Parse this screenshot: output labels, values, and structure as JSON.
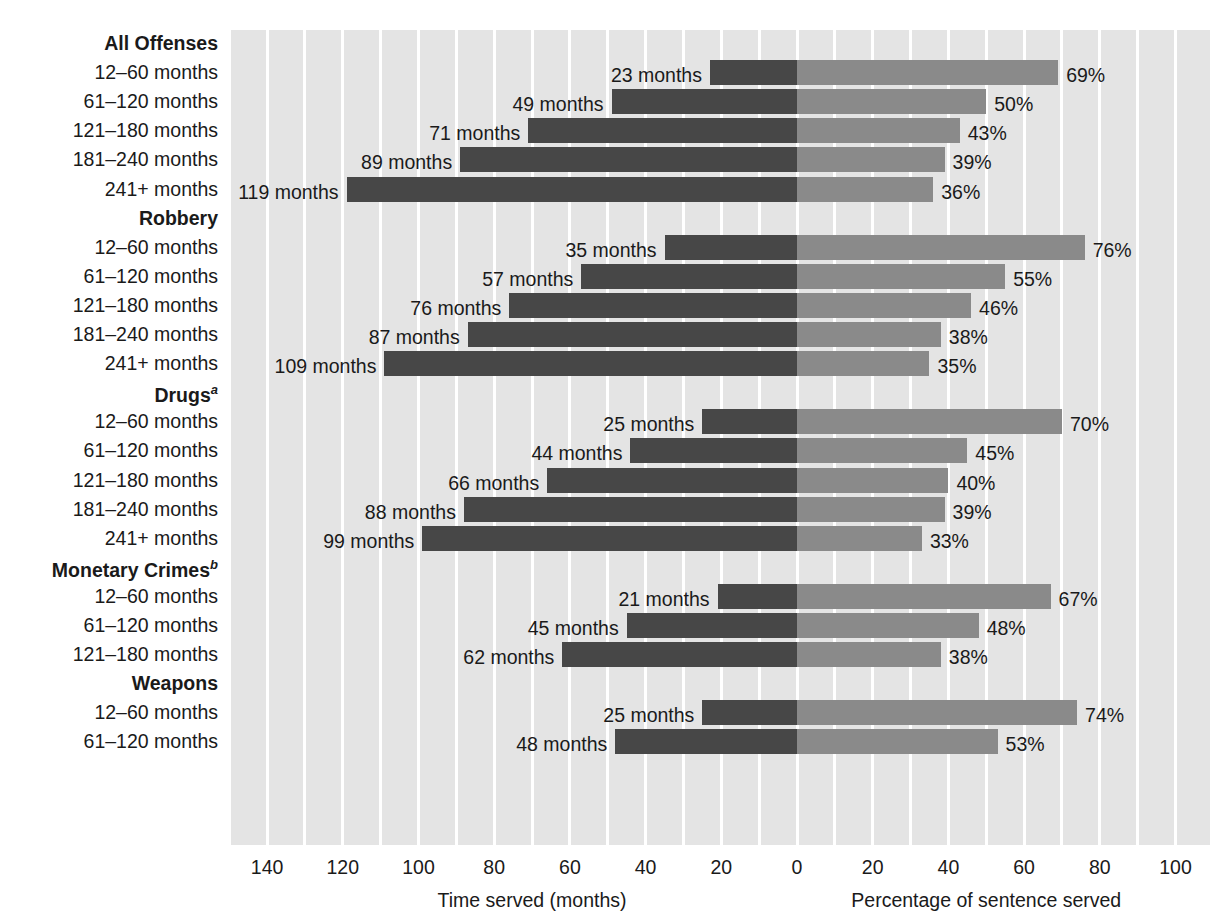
{
  "chart_data": {
    "type": "bar",
    "orientation": "horizontal",
    "variant": "diverging-bidirectional",
    "title": "",
    "left_axis": {
      "label": "Time served (months)",
      "ticks": [
        140,
        120,
        100,
        80,
        60,
        40,
        20,
        0
      ],
      "range": [
        150,
        0
      ],
      "direction": "right-to-left",
      "unit": "months"
    },
    "right_axis": {
      "label": "Percentage of sentence served",
      "ticks": [
        0,
        20,
        40,
        60,
        80,
        100
      ],
      "range": [
        0,
        109
      ],
      "direction": "left-to-right",
      "unit": "%"
    },
    "series": [
      {
        "name": "Time served (months)",
        "color": "#474747",
        "side": "left"
      },
      {
        "name": "Percentage of sentence served",
        "color": "#8a8a8a",
        "side": "right"
      }
    ],
    "grid": true,
    "gridline_interval": 10,
    "legend": "none",
    "groups": [
      {
        "name": "All Offenses",
        "footnote": "",
        "rows": [
          {
            "label": "12–60 months",
            "months": 23,
            "months_label": "23 months",
            "percent": 69,
            "percent_label": "69%"
          },
          {
            "label": "61–120 months",
            "months": 49,
            "months_label": "49 months",
            "percent": 50,
            "percent_label": "50%"
          },
          {
            "label": "121–180 months",
            "months": 71,
            "months_label": "71 months",
            "percent": 43,
            "percent_label": "43%"
          },
          {
            "label": "181–240 months",
            "months": 89,
            "months_label": "89 months",
            "percent": 39,
            "percent_label": "39%"
          },
          {
            "label": "241+ months",
            "months": 119,
            "months_label": "119 months",
            "percent": 36,
            "percent_label": "36%"
          }
        ]
      },
      {
        "name": "Robbery",
        "footnote": "",
        "rows": [
          {
            "label": "12–60 months",
            "months": 35,
            "months_label": "35 months",
            "percent": 76,
            "percent_label": "76%"
          },
          {
            "label": "61–120 months",
            "months": 57,
            "months_label": "57 months",
            "percent": 55,
            "percent_label": "55%"
          },
          {
            "label": "121–180 months",
            "months": 76,
            "months_label": "76 months",
            "percent": 46,
            "percent_label": "46%"
          },
          {
            "label": "181–240 months",
            "months": 87,
            "months_label": "87 months",
            "percent": 38,
            "percent_label": "38%"
          },
          {
            "label": "241+ months",
            "months": 109,
            "months_label": "109 months",
            "percent": 35,
            "percent_label": "35%"
          }
        ]
      },
      {
        "name": "Drugs",
        "footnote": "a",
        "rows": [
          {
            "label": "12–60 months",
            "months": 25,
            "months_label": "25 months",
            "percent": 70,
            "percent_label": "70%"
          },
          {
            "label": "61–120 months",
            "months": 44,
            "months_label": "44 months",
            "percent": 45,
            "percent_label": "45%"
          },
          {
            "label": "121–180 months",
            "months": 66,
            "months_label": "66 months",
            "percent": 40,
            "percent_label": "40%"
          },
          {
            "label": "181–240 months",
            "months": 88,
            "months_label": "88 months",
            "percent": 39,
            "percent_label": "39%"
          },
          {
            "label": "241+ months",
            "months": 99,
            "months_label": "99 months",
            "percent": 33,
            "percent_label": "33%"
          }
        ]
      },
      {
        "name": "Monetary Crimes",
        "footnote": "b",
        "rows": [
          {
            "label": "12–60 months",
            "months": 21,
            "months_label": "21 months",
            "percent": 67,
            "percent_label": "67%"
          },
          {
            "label": "61–120 months",
            "months": 45,
            "months_label": "45 months",
            "percent": 48,
            "percent_label": "48%"
          },
          {
            "label": "121–180 months",
            "months": 62,
            "months_label": "62 months",
            "percent": 38,
            "percent_label": "38%"
          }
        ]
      },
      {
        "name": "Weapons",
        "footnote": "",
        "rows": [
          {
            "label": "12–60 months",
            "months": 25,
            "months_label": "25 months",
            "percent": 74,
            "percent_label": "74%"
          },
          {
            "label": "61–120 months",
            "months": 48,
            "months_label": "48 months",
            "percent": 53,
            "percent_label": "53%"
          }
        ]
      }
    ]
  },
  "axis": {
    "left_ticks": [
      "140",
      "120",
      "100",
      "80",
      "60",
      "40",
      "20"
    ],
    "zero_tick": "0",
    "right_ticks": [
      "20",
      "40",
      "60",
      "80",
      "100"
    ],
    "left_title": "Time served (months)",
    "right_title": "Percentage of sentence served"
  },
  "colors": {
    "bar_left": "#474747",
    "bar_right": "#8a8a8a",
    "plot_background": "#e4e4e4",
    "gridline": "#ffffff",
    "text": "#1a1a1a"
  }
}
